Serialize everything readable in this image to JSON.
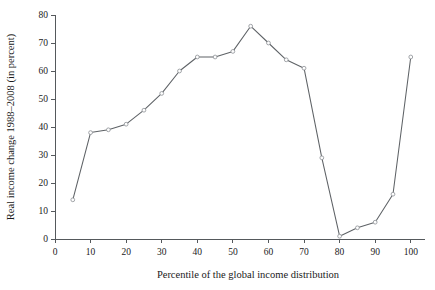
{
  "chart_data": {
    "type": "line",
    "title": "",
    "xlabel": "Percentile of  the global income distribution",
    "ylabel": "Real income change 1988–2008 (in percent)",
    "xlim": [
      0,
      104
    ],
    "ylim": [
      0,
      80
    ],
    "xticks": [
      0,
      10,
      20,
      30,
      40,
      50,
      60,
      70,
      80,
      90,
      100
    ],
    "yticks": [
      0,
      10,
      20,
      30,
      40,
      50,
      60,
      70,
      80
    ],
    "xtick_labels": [
      "0",
      "10",
      "20",
      "30",
      "40",
      "50",
      "60",
      "70",
      "80",
      "90",
      "100"
    ],
    "ytick_labels": [
      "0",
      "10",
      "20",
      "30",
      "40",
      "50",
      "60",
      "70",
      "80"
    ],
    "grid": false,
    "legend": false,
    "legend_position": "none",
    "marker": "open-circle",
    "x": [
      5,
      10,
      15,
      20,
      25,
      30,
      35,
      40,
      45,
      50,
      55,
      60,
      65,
      70,
      75,
      80,
      85,
      90,
      95,
      100
    ],
    "values": [
      14,
      38,
      39,
      41,
      46,
      52,
      60,
      65,
      65,
      67,
      76,
      70,
      64,
      61,
      29,
      1,
      4,
      6,
      16,
      65
    ],
    "series": [
      {
        "name": "Real income change 1988–2008",
        "values": [
          14,
          38,
          39,
          41,
          46,
          52,
          60,
          65,
          65,
          67,
          76,
          70,
          64,
          61,
          29,
          1,
          4,
          6,
          16,
          65
        ]
      }
    ]
  }
}
